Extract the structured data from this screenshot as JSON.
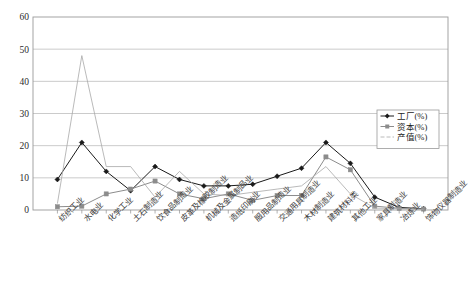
{
  "chart_data": {
    "type": "line",
    "title": "",
    "xlabel": "",
    "ylabel": "",
    "ylim": [
      0,
      60
    ],
    "yticks": [
      0,
      10,
      20,
      30,
      40,
      50,
      60
    ],
    "grid": true,
    "legend_position": "upper-right-inside",
    "categories": [
      "纺织工业",
      "水电业",
      "化学工业",
      "土石制造业",
      "饮食品制造业",
      "皮革及橡胶制造业",
      "机械及金属制品业",
      "造纸印刷业",
      "服用品制造业",
      "交通用具制造业",
      "木材制造业",
      "建筑材料类",
      "其他工业",
      "家具制造业",
      "冶炼业",
      "饰物仪器制造业"
    ],
    "series": [
      {
        "name": "工厂(%)",
        "marker": "diamond",
        "color": "#1a1a1a",
        "values": [
          9.5,
          21.0,
          12.0,
          6.0,
          13.5,
          9.5,
          7.5,
          7.5,
          8.0,
          10.5,
          13.0,
          21.0,
          14.5,
          4.0,
          0.8,
          0.4
        ]
      },
      {
        "name": "资本(%)",
        "marker": "square",
        "color": "#8c8c8c",
        "values": [
          1.0,
          1.2,
          5.0,
          6.5,
          9.0,
          5.0,
          3.5,
          5.0,
          3.0,
          4.5,
          4.5,
          16.5,
          12.5,
          1.2,
          0.5,
          0.3
        ]
      },
      {
        "name": "产值(%)",
        "marker": "none",
        "color": "#a8a8a8",
        "values": [
          2.0,
          48.0,
          13.5,
          13.5,
          4.0,
          12.0,
          5.0,
          4.5,
          5.5,
          6.5,
          7.5,
          13.5,
          5.0,
          0.6,
          0.4,
          0.2
        ]
      }
    ]
  },
  "legend": {
    "items": [
      {
        "label": "工厂(%)"
      },
      {
        "label": "资本(%)"
      },
      {
        "label": "产值(%)"
      }
    ]
  },
  "axis": {
    "y_tick_labels": [
      "0",
      "10",
      "20",
      "30",
      "40",
      "50",
      "60"
    ]
  },
  "style": {
    "plot_border": "#9a9a9a",
    "gridline": "#b5b5b5",
    "background": "#ffffff"
  }
}
